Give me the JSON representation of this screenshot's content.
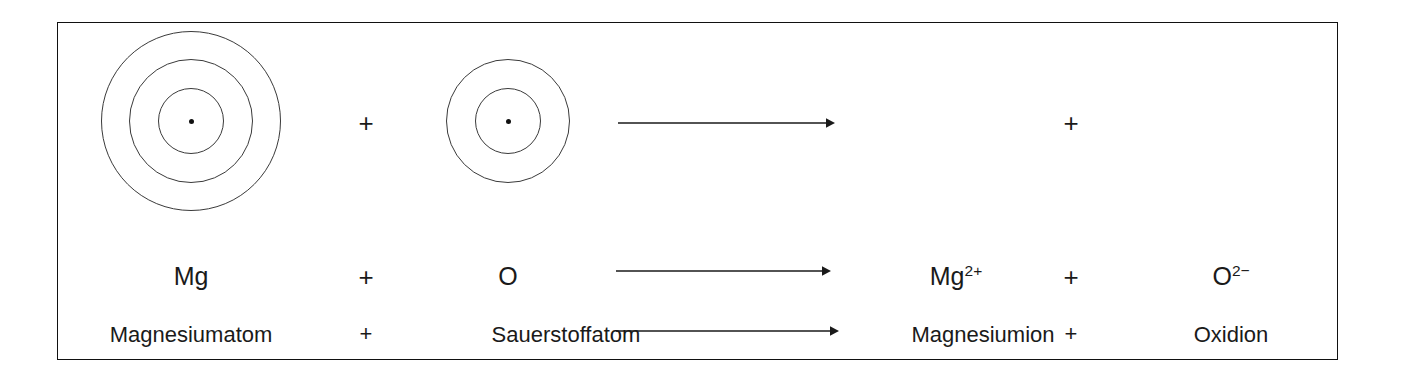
{
  "figure": {
    "border_color": "#111111",
    "ink_color": "#1a1a1a",
    "ring_color": "#3a3a3a",
    "background": "#ffffff"
  },
  "shell_row": {
    "magnesium_atom": {
      "label": "Magnesiumatom-Schalenmodell",
      "shells": 3,
      "nucleus": "nucleus-dot",
      "shell_radii": [
        33,
        62,
        90
      ]
    },
    "plus_1": "+",
    "oxygen_atom": {
      "label": "Sauerstoffatom-Schalenmodell",
      "shells": 2,
      "nucleus": "nucleus-dot",
      "shell_radii": [
        33,
        62
      ]
    },
    "arrow": "reaction-arrow",
    "plus_2": "+"
  },
  "formula_row": {
    "reactant_1": "Mg",
    "plus_1": "+",
    "reactant_2": "O",
    "arrow": "reaction-arrow",
    "product_1_symbol": "Mg",
    "product_1_charge": "2+",
    "plus_2": "+",
    "product_2_symbol": "O",
    "product_2_charge": "2−"
  },
  "name_row": {
    "reactant_1": "Magnesiumatom",
    "plus_1": "+",
    "reactant_2": "Sauerstoffatom",
    "arrow": "reaction-arrow",
    "product_1": "Magnesiumion",
    "plus_2": "+",
    "product_2": "Oxidion"
  }
}
